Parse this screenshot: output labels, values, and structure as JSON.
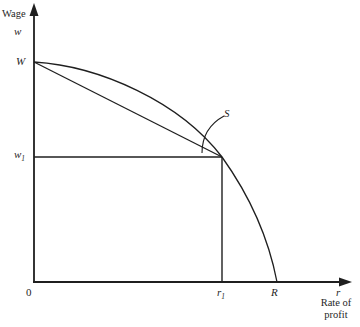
{
  "colors": {
    "background": "#ffffff",
    "ink": "#1f1f1f"
  },
  "y_axis": {
    "title": "Wage",
    "symbol": "w"
  },
  "x_axis": {
    "symbol": "r",
    "title_line1": "Rate of",
    "title_line2": "profit"
  },
  "points": {
    "origin": "0",
    "max_wage": "W",
    "wage_level_base": "w",
    "wage_level_sub": "1",
    "profit_rate_base": "r",
    "profit_rate_sub": "1",
    "max_profit_rate": "R",
    "switch_point": "S"
  }
}
